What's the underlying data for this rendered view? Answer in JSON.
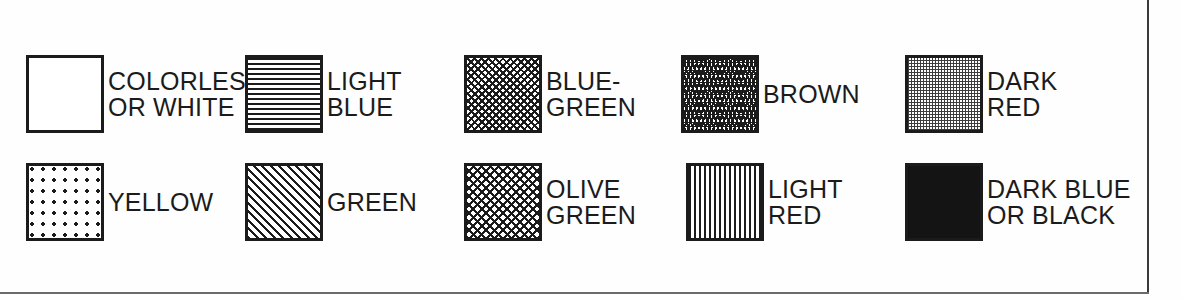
{
  "panel": {
    "title": "Mineral color pattern legend",
    "background_color": "#fefefe",
    "ink_color": "#1b1b1b",
    "border_color": "#3a3a3a"
  },
  "rows": [
    {
      "row_index": 1,
      "entries": [
        {
          "label": "COLORLESS\nOR WHITE",
          "pattern": "blank",
          "swatch_name": "swatch-colorless-or-white"
        },
        {
          "label": "LIGHT\nBLUE",
          "pattern": "horizontal",
          "swatch_name": "swatch-light-blue"
        },
        {
          "label": "BLUE-\nGREEN",
          "pattern": "crosshatch-med",
          "swatch_name": "swatch-blue-green"
        },
        {
          "label": "BROWN",
          "pattern": "crosshatch-dense",
          "swatch_name": "swatch-brown"
        },
        {
          "label": "DARK\nRED",
          "pattern": "stipple-fine",
          "swatch_name": "swatch-dark-red"
        }
      ]
    },
    {
      "row_index": 2,
      "entries": [
        {
          "label": "YELLOW",
          "pattern": "stipple-sparse",
          "swatch_name": "swatch-yellow"
        },
        {
          "label": "GREEN",
          "pattern": "diagonal",
          "swatch_name": "swatch-green"
        },
        {
          "label": "OLIVE\nGREEN",
          "pattern": "crosshatch-open",
          "swatch_name": "swatch-olive-green"
        },
        {
          "label": "LIGHT\nRED",
          "pattern": "vertical",
          "swatch_name": "swatch-light-red"
        },
        {
          "label": "DARK BLUE\nOR BLACK",
          "pattern": "solid",
          "swatch_name": "swatch-dark-blue-or-black"
        }
      ]
    }
  ]
}
